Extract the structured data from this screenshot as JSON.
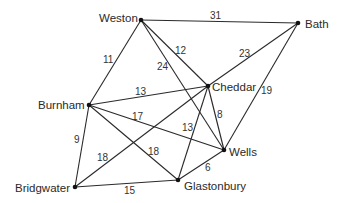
{
  "diagram": {
    "type": "weighted-undirected-graph",
    "nodes": [
      {
        "id": "weston",
        "label": "Weston",
        "x": 141,
        "y": 20,
        "lx": 99,
        "ly": 22,
        "anchor": "start"
      },
      {
        "id": "bath",
        "label": "Bath",
        "x": 298,
        "y": 23,
        "lx": 305,
        "ly": 28,
        "anchor": "start"
      },
      {
        "id": "cheddar",
        "label": "Cheddar",
        "x": 208,
        "y": 86,
        "lx": 212,
        "ly": 91,
        "anchor": "start"
      },
      {
        "id": "burnham",
        "label": "Burnham",
        "x": 89,
        "y": 105,
        "lx": 38,
        "ly": 109,
        "anchor": "start"
      },
      {
        "id": "wells",
        "label": "Wells",
        "x": 224,
        "y": 150,
        "lx": 229,
        "ly": 156,
        "anchor": "start"
      },
      {
        "id": "bridgwater",
        "label": "Bridgwater",
        "x": 75,
        "y": 187,
        "lx": 15,
        "ly": 192,
        "anchor": "start"
      },
      {
        "id": "glastonbury",
        "label": "Glastonbury",
        "x": 178,
        "y": 180,
        "lx": 184,
        "ly": 190,
        "anchor": "start"
      }
    ],
    "edges": [
      {
        "from": "weston",
        "to": "bath",
        "weight": "31",
        "lx": 210,
        "ly": 19
      },
      {
        "from": "weston",
        "to": "cheddar",
        "weight": "12",
        "lx": 175,
        "ly": 54
      },
      {
        "from": "weston",
        "to": "wells",
        "weight": "24",
        "lx": 157,
        "ly": 70
      },
      {
        "from": "weston",
        "to": "burnham",
        "weight": "11",
        "lx": 103,
        "ly": 63
      },
      {
        "from": "bath",
        "to": "cheddar",
        "weight": "23",
        "lx": 239,
        "ly": 57
      },
      {
        "from": "bath",
        "to": "wells",
        "weight": "19",
        "lx": 261,
        "ly": 94
      },
      {
        "from": "burnham",
        "to": "cheddar",
        "weight": "13",
        "lx": 135,
        "ly": 95
      },
      {
        "from": "burnham",
        "to": "wells",
        "weight": "17",
        "lx": 132,
        "ly": 120
      },
      {
        "from": "burnham",
        "to": "glastonbury",
        "weight": "18",
        "lx": 148,
        "ly": 155
      },
      {
        "from": "burnham",
        "to": "bridgwater",
        "weight": "9",
        "lx": 74,
        "ly": 143
      },
      {
        "from": "cheddar",
        "to": "wells",
        "weight": "8",
        "lx": 217,
        "ly": 118
      },
      {
        "from": "cheddar",
        "to": "glastonbury",
        "weight": "13",
        "lx": 182,
        "ly": 131
      },
      {
        "from": "cheddar",
        "to": "bridgwater",
        "weight": "18",
        "lx": 97,
        "ly": 161
      },
      {
        "from": "wells",
        "to": "glastonbury",
        "weight": "6",
        "lx": 205,
        "ly": 171
      },
      {
        "from": "bridgwater",
        "to": "glastonbury",
        "weight": "15",
        "lx": 124,
        "ly": 194
      }
    ]
  }
}
